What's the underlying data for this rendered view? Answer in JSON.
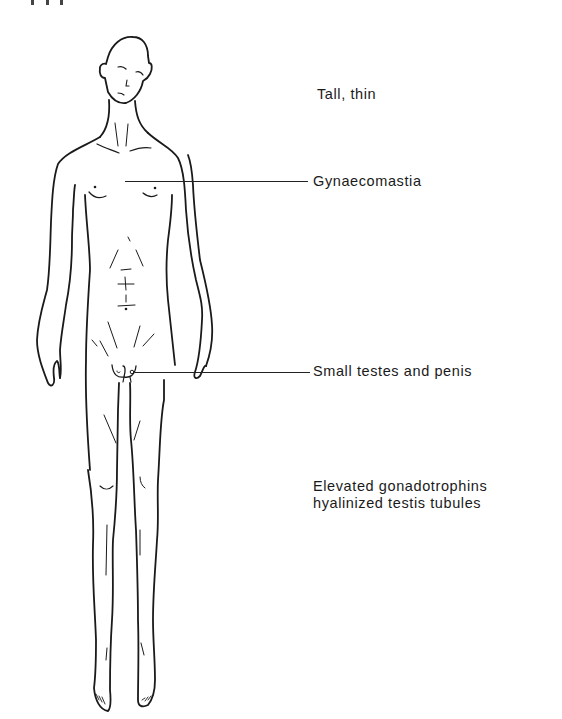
{
  "figure": {
    "stroke_color": "#1a1a1a",
    "background": "#ffffff"
  },
  "annotations": [
    {
      "id": "tall-thin",
      "lines": [
        "Tall, thin"
      ],
      "has_leader": false
    },
    {
      "id": "gynaecomastia",
      "lines": [
        "Gynaecomastia"
      ],
      "has_leader": true
    },
    {
      "id": "small-testes",
      "lines": [
        "Small testes and penis"
      ],
      "has_leader": true
    },
    {
      "id": "gonadotrophins",
      "lines": [
        "Elevated gonadotrophins",
        "hyalinized testis tubules"
      ],
      "has_leader": false
    }
  ]
}
